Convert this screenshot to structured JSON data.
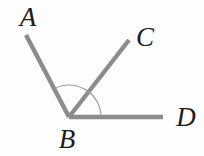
{
  "diagram": {
    "type": "geometry-angle-diagram",
    "colors": {
      "ray": "#8c8c8c",
      "arc": "#9e9e9e",
      "label": "#1c1c1c",
      "background": "#fdfdfd"
    },
    "vertex": {
      "name": "B",
      "x": 69,
      "y": 117
    },
    "rays": [
      {
        "name": "BA",
        "x1": 69,
        "y1": 117,
        "x2": 26,
        "y2": 35
      },
      {
        "name": "BC",
        "x1": 69,
        "y1": 117,
        "x2": 129,
        "y2": 40
      },
      {
        "name": "BD",
        "x1": 69,
        "y1": 117,
        "x2": 163,
        "y2": 117
      }
    ],
    "angle_arc": {
      "marks": "angle-ABD",
      "radius": 32,
      "path": "M 101 117 A 32 32 0 0 0 54.1 88.7"
    },
    "labels": [
      {
        "text": "A",
        "x": 28,
        "y": 17
      },
      {
        "text": "C",
        "x": 145,
        "y": 37
      },
      {
        "text": "B",
        "x": 67,
        "y": 139
      },
      {
        "text": "D",
        "x": 186,
        "y": 117
      }
    ]
  }
}
